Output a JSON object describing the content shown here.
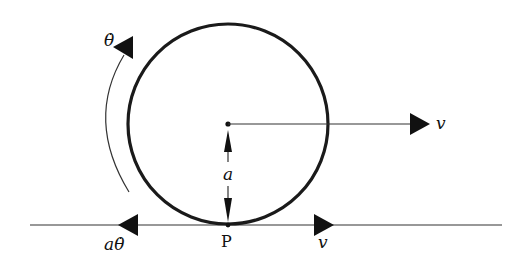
{
  "diagram": {
    "colors": {
      "stroke": "#111111",
      "background": "#ffffff"
    },
    "labels": {
      "angular_velocity": "θ̇",
      "center_velocity": "v",
      "radius": "a",
      "contact_point": "P",
      "contact_rotation_velocity": "aθ̇",
      "contact_translation_velocity": "v"
    },
    "geometry": {
      "circle_center": [
        228,
        124
      ],
      "radius_px": 99,
      "ground_y": 225,
      "ground_x_range": [
        30,
        502
      ]
    }
  }
}
